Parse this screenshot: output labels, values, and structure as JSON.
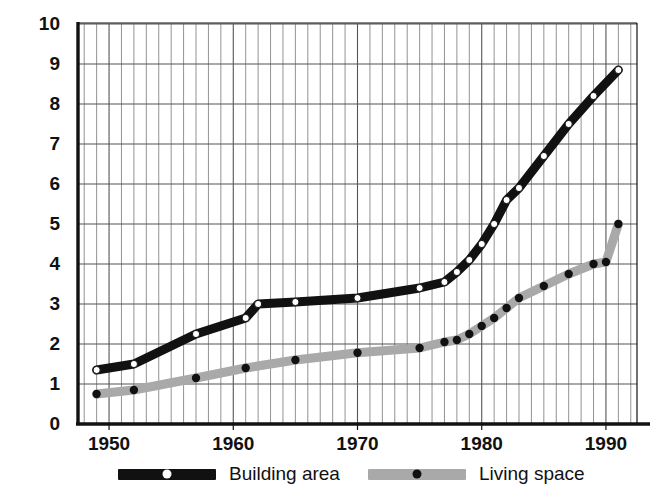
{
  "chart_data": {
    "type": "line",
    "title": "",
    "subtitle": "",
    "xlabel": "",
    "ylabel": "",
    "xlim": [
      1947.5,
      1992.5
    ],
    "ylim": [
      0,
      10
    ],
    "grid": true,
    "x_ticks": [
      1950,
      1960,
      1970,
      1980,
      1990
    ],
    "x_tick_labels": [
      "1950",
      "1960",
      "1970",
      "1980",
      "1990"
    ],
    "x_minor_step": 1,
    "y_ticks": [
      0,
      1,
      2,
      3,
      4,
      5,
      6,
      7,
      8,
      9,
      10
    ],
    "y_tick_labels": [
      "0",
      "1",
      "2",
      "3",
      "4",
      "5",
      "6",
      "7",
      "8",
      "9",
      "10"
    ],
    "legend_position": "bottom",
    "series": [
      {
        "name": "Building area",
        "color": "#111111",
        "marker_color": "#ffffff",
        "marker": "circle-open",
        "x": [
          1949,
          1952,
          1957,
          1961,
          1962,
          1965,
          1970,
          1975,
          1977,
          1978,
          1979,
          1980,
          1981,
          1982,
          1983,
          1985,
          1987,
          1989,
          1991
        ],
        "y": [
          1.35,
          1.5,
          2.25,
          2.65,
          3.0,
          3.05,
          3.15,
          3.4,
          3.55,
          3.8,
          4.1,
          4.5,
          5.0,
          5.6,
          5.9,
          6.7,
          7.5,
          8.2,
          8.85
        ]
      },
      {
        "name": "Living space",
        "color": "#a9a9a9",
        "marker_color": "#111111",
        "marker": "circle-filled",
        "x": [
          1949,
          1952,
          1957,
          1961,
          1965,
          1970,
          1975,
          1977,
          1978,
          1979,
          1980,
          1981,
          1982,
          1983,
          1985,
          1987,
          1989,
          1990,
          1991
        ],
        "y": [
          0.75,
          0.85,
          1.15,
          1.4,
          1.6,
          1.78,
          1.9,
          2.05,
          2.1,
          2.25,
          2.45,
          2.65,
          2.9,
          3.15,
          3.45,
          3.75,
          4.0,
          4.05,
          5.0
        ]
      }
    ]
  },
  "legend": {
    "items": [
      {
        "label": "Building area",
        "line_color": "#111111",
        "dot_color": "#ffffff"
      },
      {
        "label": "Living space",
        "line_color": "#a9a9a9",
        "dot_color": "#111111"
      }
    ]
  },
  "axes": {
    "axis_color": "#111111",
    "major_grid_color": "#555555",
    "minor_grid_color": "#777777"
  }
}
